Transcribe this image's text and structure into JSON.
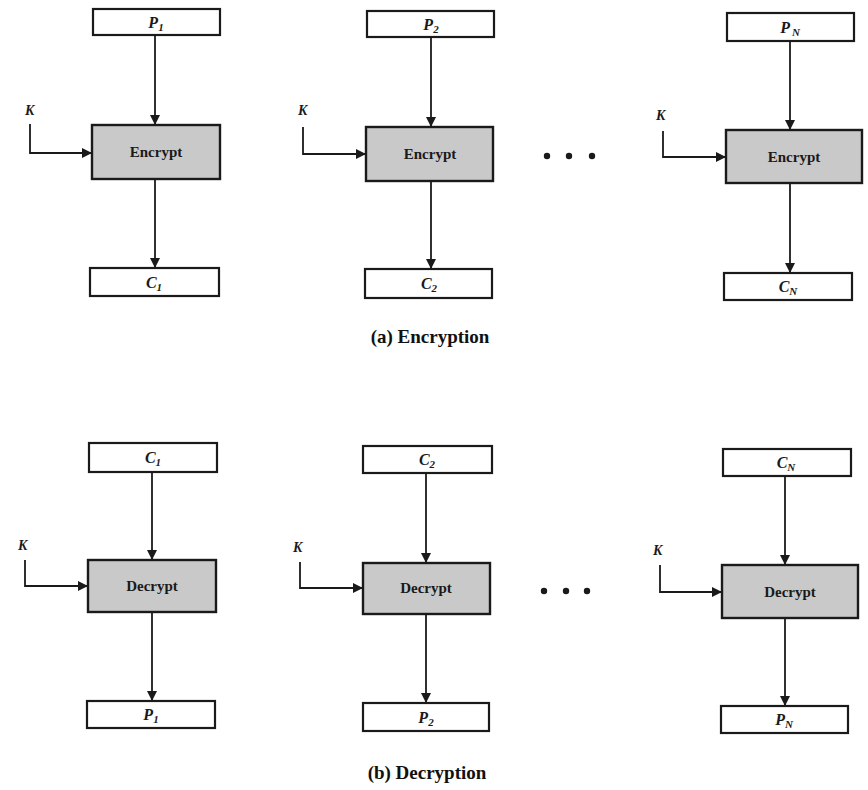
{
  "encryption": {
    "caption": "(a) Encryption",
    "columns": [
      {
        "input": {
          "base": "P",
          "sub": "1"
        },
        "op": "Encrypt",
        "key": "K",
        "output": {
          "base": "C",
          "sub": "1"
        }
      },
      {
        "input": {
          "base": "P",
          "sub": "2"
        },
        "op": "Encrypt",
        "key": "K",
        "output": {
          "base": "C",
          "sub": "2"
        }
      },
      {
        "input": {
          "base": "P",
          "sub": "N"
        },
        "op": "Encrypt",
        "key": "K",
        "output": {
          "base": "C",
          "sub": "N"
        }
      }
    ],
    "ellipsis": "• • •"
  },
  "decryption": {
    "caption": "(b) Decryption",
    "columns": [
      {
        "input": {
          "base": "C",
          "sub": "1"
        },
        "op": "Decrypt",
        "key": "K",
        "output": {
          "base": "P",
          "sub": "1"
        }
      },
      {
        "input": {
          "base": "C",
          "sub": "2"
        },
        "op": "Decrypt",
        "key": "K",
        "output": {
          "base": "P",
          "sub": "2"
        }
      },
      {
        "input": {
          "base": "C",
          "sub": "N"
        },
        "op": "Decrypt",
        "key": "K",
        "output": {
          "base": "P",
          "sub": "N"
        }
      }
    ],
    "ellipsis": "• • •"
  },
  "colors": {
    "op_fill": "#c9c9c9",
    "stroke": "#1a1a1a",
    "background": "#ffffff"
  }
}
